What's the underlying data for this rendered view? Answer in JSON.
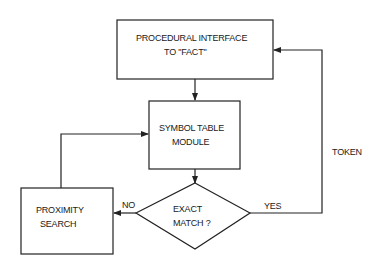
{
  "nodes": {
    "procedural_interface": {
      "line1": "PROCEDURAL INTERFACE",
      "line2": "TO  \"FACT\""
    },
    "symbol_table": {
      "line1": "SYMBOL TABLE",
      "line2": "MODULE"
    },
    "exact_match": {
      "line1": "EXACT",
      "line2": "MATCH ?"
    },
    "proximity_search": {
      "line1": "PROXIMITY",
      "line2": "SEARCH"
    }
  },
  "edges": {
    "no_label": "NO",
    "yes_label": "YES",
    "token_label": "TOKEN"
  }
}
